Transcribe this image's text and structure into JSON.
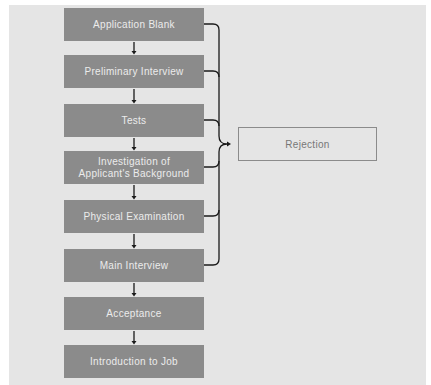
{
  "diagram": {
    "steps": [
      {
        "label": "Application Blank"
      },
      {
        "label": "Preliminary Interview"
      },
      {
        "label": "Tests"
      },
      {
        "label": "Investigation of Applicant's Background"
      },
      {
        "label": "Physical Examination"
      },
      {
        "label": "Main Interview"
      },
      {
        "label": "Acceptance"
      },
      {
        "label": "Introduction to Job"
      }
    ],
    "rejection": {
      "label": "Rejection"
    },
    "rejection_sources": [
      0,
      1,
      2,
      3,
      4,
      5
    ],
    "colors": {
      "box_fill": "#8b8b8b",
      "box_text": "#ececec",
      "background": "#e5e5e5",
      "line": "#1a1a1a",
      "rejection_border": "#8b8b8b",
      "rejection_text": "#777777"
    }
  }
}
